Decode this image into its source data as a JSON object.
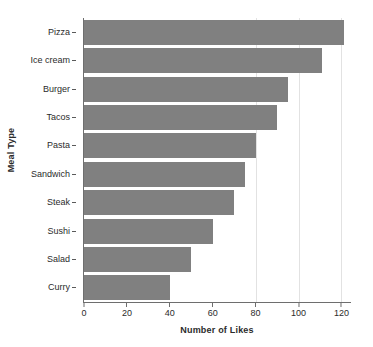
{
  "chart_data": {
    "type": "bar",
    "orientation": "horizontal",
    "title": "",
    "xlabel": "Number of Likes",
    "ylabel": "Meal Type",
    "categories": [
      "Pizza",
      "Ice cream",
      "Burger",
      "Tacos",
      "Pasta",
      "Sandwich",
      "Steak",
      "Sushi",
      "Salad",
      "Curry"
    ],
    "values": [
      121,
      111,
      95,
      90,
      80,
      75,
      70,
      60,
      50,
      40
    ],
    "xlim": [
      0,
      124
    ],
    "xticks": [
      0,
      20,
      40,
      60,
      80,
      100,
      120
    ],
    "xtick_labels": [
      "0",
      "20",
      "40",
      "60",
      "80",
      "100",
      "120"
    ],
    "gridlines": [
      80,
      100,
      120
    ],
    "grid": true,
    "legend": null,
    "bar_color": "#808080",
    "axis_color": "#6e6e6e",
    "grid_color": "#e2e2e2",
    "background": "#ffffff"
  }
}
